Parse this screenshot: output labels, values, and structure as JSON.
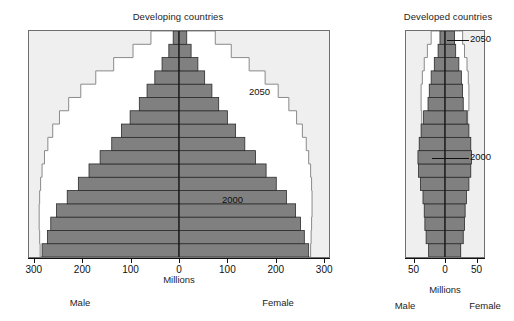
{
  "figure": {
    "units_label": "Millions",
    "male_label": "Male",
    "female_label": "Female",
    "bar_color": "#808080",
    "bar_edge_color": "#2b2b2b",
    "outline_color": "#8a8a8a",
    "panel_bg": "#efefef",
    "frame_color": "#6f6f6f"
  },
  "panels": {
    "developing": {
      "title": "Developing countries",
      "annotation_2000": "2000",
      "annotation_2050": "2050",
      "axis": {
        "ticks": [
          "300",
          "200",
          "100",
          "0",
          "100",
          "200",
          "300"
        ],
        "tick_values": [
          -300,
          -200,
          -100,
          0,
          100,
          200,
          300
        ],
        "xlim": [
          -310,
          310
        ]
      }
    },
    "developed": {
      "title": "Developed countries",
      "annotation_2000": "2000",
      "annotation_2050": "2050",
      "axis": {
        "ticks": [
          "50",
          "0",
          "50"
        ],
        "tick_values": [
          -50,
          0,
          50
        ],
        "xlim": [
          -62,
          62
        ]
      }
    }
  },
  "chart_data": [
    {
      "type": "bar",
      "chart_id": "developing-population-pyramid",
      "title": "Developing countries",
      "xlabel": "Millions",
      "ylabel": "",
      "orientation": "horizontal-pyramid",
      "xlim": [
        -310,
        310
      ],
      "xticks": [
        -300,
        -200,
        -100,
        0,
        100,
        200,
        300
      ],
      "xticklabels": [
        "300",
        "200",
        "100",
        "0",
        "100",
        "200",
        "300"
      ],
      "grid": false,
      "legend": "inline annotations",
      "annotations": [
        {
          "text": "2050",
          "meaning": "outline step profile for year 2050"
        },
        {
          "text": "2000",
          "meaning": "filled grey bars for year 2000"
        }
      ],
      "age_groups": [
        "0-4",
        "5-9",
        "10-14",
        "15-19",
        "20-24",
        "25-29",
        "30-34",
        "35-39",
        "40-44",
        "45-49",
        "50-54",
        "55-59",
        "60-64",
        "65-69",
        "70-74",
        "75-79",
        "80+"
      ],
      "series": [
        {
          "name": "2000 male",
          "side": "left",
          "values": [
            283,
            272,
            265,
            253,
            231,
            208,
            186,
            163,
            139,
            119,
            101,
            82,
            66,
            50,
            35,
            21,
            12
          ]
        },
        {
          "name": "2000 female",
          "side": "right",
          "values": [
            268,
            259,
            251,
            241,
            222,
            201,
            180,
            158,
            136,
            117,
            100,
            82,
            68,
            53,
            39,
            25,
            16
          ]
        },
        {
          "name": "2050 male",
          "side": "left",
          "values": [
            287,
            288,
            289,
            289,
            288,
            286,
            283,
            278,
            271,
            261,
            247,
            228,
            203,
            172,
            135,
            95,
            58
          ]
        },
        {
          "name": "2050 female",
          "side": "right",
          "values": [
            272,
            273,
            274,
            275,
            275,
            274,
            272,
            268,
            263,
            255,
            243,
            227,
            205,
            178,
            145,
            108,
            75
          ]
        }
      ]
    },
    {
      "type": "bar",
      "chart_id": "developed-population-pyramid",
      "title": "Developed countries",
      "xlabel": "Millions",
      "ylabel": "",
      "orientation": "horizontal-pyramid",
      "xlim": [
        -62,
        62
      ],
      "xticks": [
        -50,
        0,
        50
      ],
      "xticklabels": [
        "50",
        "0",
        "50"
      ],
      "grid": false,
      "legend": "inline annotations",
      "annotations": [
        {
          "text": "2050",
          "meaning": "outline step profile for year 2050"
        },
        {
          "text": "2000",
          "meaning": "filled grey bars for year 2000"
        }
      ],
      "age_groups": [
        "0-4",
        "5-9",
        "10-14",
        "15-19",
        "20-24",
        "25-29",
        "30-34",
        "35-39",
        "40-44",
        "45-49",
        "50-54",
        "55-59",
        "60-64",
        "65-69",
        "70-74",
        "75-79",
        "80+"
      ],
      "series": [
        {
          "name": "2000 male",
          "side": "left",
          "values": [
            26,
            30,
            32,
            33,
            35,
            39,
            42,
            43,
            41,
            38,
            34,
            27,
            25,
            22,
            17,
            11,
            8
          ]
        },
        {
          "name": "2000 female",
          "side": "right",
          "values": [
            25,
            29,
            31,
            32,
            34,
            38,
            41,
            42,
            41,
            38,
            35,
            29,
            28,
            26,
            22,
            17,
            15
          ]
        },
        {
          "name": "2050 male",
          "side": "left",
          "values": [
            25,
            26,
            26,
            27,
            28,
            29,
            30,
            32,
            34,
            36,
            37,
            38,
            38,
            36,
            33,
            28,
            22
          ]
        },
        {
          "name": "2050 female",
          "side": "right",
          "values": [
            24,
            25,
            25,
            26,
            27,
            28,
            29,
            31,
            33,
            35,
            36,
            38,
            38,
            37,
            35,
            31,
            28
          ]
        }
      ]
    }
  ]
}
